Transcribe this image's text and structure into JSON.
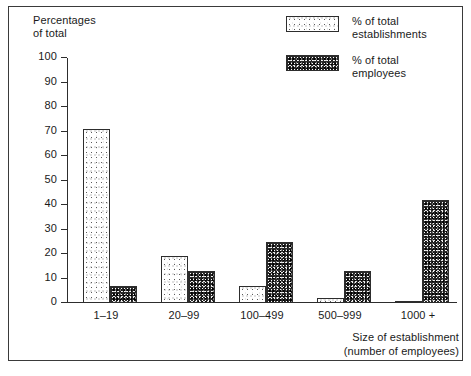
{
  "chart_data": {
    "type": "bar",
    "title": "",
    "categories": [
      "1–19",
      "20–99",
      "100–499",
      "500–999",
      "1000 +"
    ],
    "series": [
      {
        "name": "% of total\nestablishments",
        "values": [
          71,
          19,
          7,
          2,
          1
        ],
        "pattern": "light-stipple"
      },
      {
        "name": "% of total\nemployees",
        "values": [
          7,
          13,
          25,
          13,
          42
        ],
        "pattern": "dark-stipple"
      }
    ],
    "ylabel": "Percentages\nof  total",
    "xlabel": "Size of establishment\n(number of employees)",
    "ylim": [
      0,
      100
    ],
    "ytick_labels": [
      "100",
      "90",
      "80",
      "70",
      "60",
      "50",
      "40",
      "30",
      "20",
      "10",
      "0"
    ],
    "ytick_values": [
      100,
      90,
      80,
      70,
      60,
      50,
      40,
      30,
      20,
      10,
      0
    ],
    "grid": false,
    "legend_position": "top-right",
    "colors": {
      "axis": "#2d2d2d",
      "text": "#1a1a1a",
      "background": "#ffffff",
      "series_light": "#ffffff",
      "series_dark": "#2a2a2a"
    }
  },
  "axis_titles": {
    "y": "Percentages\nof  total",
    "x": "Size of establishment\n(number of employees)"
  },
  "legend": {
    "items": [
      {
        "label": "% of total\nestablishments",
        "swatch": "light-stipple-swatch"
      },
      {
        "label": "% of total\nemployees",
        "swatch": "dark-stipple-swatch"
      }
    ]
  }
}
